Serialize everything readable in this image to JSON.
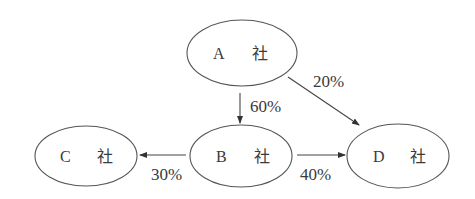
{
  "diagram": {
    "type": "ownership-flow",
    "nodes": [
      {
        "id": "A",
        "letter": "A",
        "suffix": "社",
        "label": "A 社",
        "cx": 242,
        "cy": 53,
        "rx": 55,
        "ry": 33
      },
      {
        "id": "B",
        "letter": "B",
        "suffix": "社",
        "label": "B 社",
        "cx": 241,
        "cy": 156,
        "rx": 51,
        "ry": 31
      },
      {
        "id": "C",
        "letter": "C",
        "suffix": "社",
        "label": "C 社",
        "cx": 86,
        "cy": 156,
        "rx": 51,
        "ry": 30
      },
      {
        "id": "D",
        "letter": "D",
        "suffix": "社",
        "label": "D 社",
        "cx": 398,
        "cy": 156,
        "rx": 51,
        "ry": 32
      }
    ],
    "edges": [
      {
        "from": "A",
        "to": "B",
        "label": "60%"
      },
      {
        "from": "A",
        "to": "D",
        "label": "20%"
      },
      {
        "from": "B",
        "to": "C",
        "label": "30%"
      },
      {
        "from": "B",
        "to": "D",
        "label": "40%"
      }
    ]
  },
  "colors": {
    "stroke": "#555555",
    "text": "#3a3a3a",
    "background": "#ffffff"
  }
}
